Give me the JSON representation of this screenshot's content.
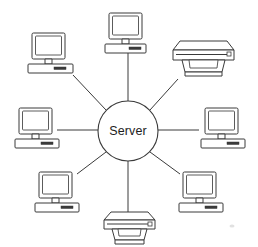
{
  "diagram": {
    "type": "star-network-topology",
    "background_color": "#ffffff",
    "line_color": "#3a3a3a",
    "hub": {
      "label": "Server",
      "shape": "circle",
      "cx": 128,
      "cy": 131,
      "r": 30,
      "fill": "#ffffff",
      "stroke": "#3a3a3a",
      "text_color": "#1d1d1d"
    },
    "nodes": [
      {
        "id": "computer-top",
        "kind": "computer",
        "label": "Workstation",
        "position": "top",
        "x": 105,
        "y": 13,
        "connector_from": {
          "x": 128,
          "y": 53
        },
        "connector_to": {
          "x": 128,
          "y": 101
        }
      },
      {
        "id": "printer-top-right",
        "kind": "printer",
        "label": "Printer",
        "position": "top-right",
        "x": 170,
        "y": 41,
        "connector_from": {
          "x": 178,
          "y": 79
        },
        "connector_to": {
          "x": 150,
          "y": 110
        }
      },
      {
        "id": "computer-right",
        "kind": "computer",
        "label": "Workstation",
        "position": "right",
        "x": 200,
        "y": 108,
        "connector_from": {
          "x": 199,
          "y": 130
        },
        "connector_to": {
          "x": 158,
          "y": 130
        }
      },
      {
        "id": "computer-bottom-right",
        "kind": "computer",
        "label": "Workstation",
        "position": "bottom-right",
        "x": 178,
        "y": 172,
        "connector_from": {
          "x": 178,
          "y": 172
        },
        "connector_to": {
          "x": 150,
          "y": 152
        }
      },
      {
        "id": "printer-bottom",
        "kind": "printer",
        "label": "Printer",
        "position": "bottom",
        "x": 101,
        "y": 212,
        "connector_from": {
          "x": 128,
          "y": 212
        },
        "connector_to": {
          "x": 128,
          "y": 161
        }
      },
      {
        "id": "computer-bottom-left",
        "kind": "computer",
        "label": "Workstation",
        "position": "bottom-left",
        "x": 34,
        "y": 172,
        "connector_from": {
          "x": 78,
          "y": 172
        },
        "connector_to": {
          "x": 106,
          "y": 152
        }
      },
      {
        "id": "computer-left",
        "kind": "computer",
        "label": "Workstation",
        "position": "left",
        "x": 14,
        "y": 108,
        "connector_from": {
          "x": 57,
          "y": 130
        },
        "connector_to": {
          "x": 98,
          "y": 130
        }
      },
      {
        "id": "computer-top-left",
        "kind": "computer",
        "label": "Workstation",
        "position": "top-left",
        "x": 24,
        "y": 33,
        "connector_from": {
          "x": 73,
          "y": 75
        },
        "connector_to": {
          "x": 106,
          "y": 110
        }
      }
    ],
    "link_count": 8,
    "computer_count": 6,
    "printer_count": 2
  }
}
